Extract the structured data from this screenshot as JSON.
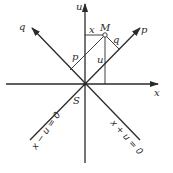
{
  "diagram": {
    "type": "coordinate-rotation",
    "origin_label": "S",
    "point_label": "M",
    "axes": [
      {
        "name": "x",
        "label": "x",
        "direction": "horizontal"
      },
      {
        "name": "u",
        "label": "u",
        "direction": "vertical"
      },
      {
        "name": "p",
        "label": "p",
        "direction": "diagonal-up-right"
      },
      {
        "name": "q",
        "label": "q",
        "direction": "diagonal-up-left"
      }
    ],
    "segment_labels": {
      "x": "x",
      "u": "u",
      "p": "p",
      "q": "q"
    },
    "line_equations": {
      "left": "x − u = 0",
      "right": "x + u = 0"
    },
    "colors": {
      "ink": "#2a2a2a",
      "background": "#ffffff"
    }
  }
}
